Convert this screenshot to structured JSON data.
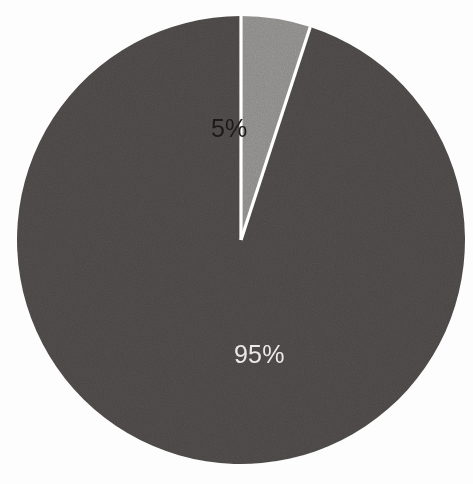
{
  "figure": {
    "kind": "pie-chart",
    "background_color": "#fdfdfd",
    "separator_color": "#ffffff"
  },
  "chart_data": {
    "type": "pie",
    "title": "",
    "subtitle": "",
    "xlabel": "",
    "ylabel": "",
    "labels": [
      "95%",
      "5%"
    ],
    "values": [
      95,
      5
    ],
    "value_unit": "percent",
    "colors": [
      "#4a4544",
      "#888786"
    ],
    "label_text_colors": [
      "#ece9e6",
      "#1d1b1a"
    ],
    "legend": false,
    "legend_position": "none",
    "grid": false,
    "data_labels_shown": true,
    "start_angle_deg": -72,
    "direction": "counterclockwise",
    "slices": [
      {
        "label": "95%",
        "value": 95,
        "color": "#4a4544",
        "label_color": "#ece9e6",
        "start_angle_deg": -72,
        "end_angle_deg": 270
      },
      {
        "label": "5%",
        "value": 5,
        "color": "#888786",
        "label_color": "#1d1b1a",
        "start_angle_deg": -90,
        "end_angle_deg": -72
      }
    ]
  },
  "geometry": {
    "center_x": 241,
    "center_y": 240,
    "radius": 224
  },
  "labels": {
    "major": "95%",
    "minor": "5%"
  }
}
